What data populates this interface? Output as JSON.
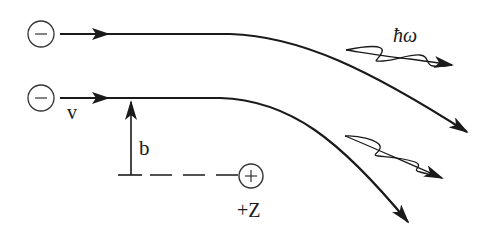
{
  "diagram": {
    "electrons": [
      {
        "symbol": "−",
        "label": ""
      },
      {
        "symbol": "−",
        "label": "v"
      }
    ],
    "nucleus": {
      "symbol": "+",
      "label": "+Z"
    },
    "impact_parameter": {
      "label": "b"
    },
    "photon": {
      "label": "ħω"
    },
    "colors": {
      "stroke": "#1a1a1a",
      "background": "#ffffff"
    }
  }
}
